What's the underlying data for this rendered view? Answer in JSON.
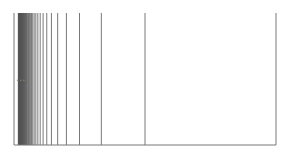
{
  "diagram": {
    "origin_x": 14,
    "span": 262,
    "top_y": 13,
    "bottom_y": 145,
    "n_max": 60,
    "line_color": "#555555",
    "axis_color": "#777777",
    "ellipsis_label": "..."
  }
}
